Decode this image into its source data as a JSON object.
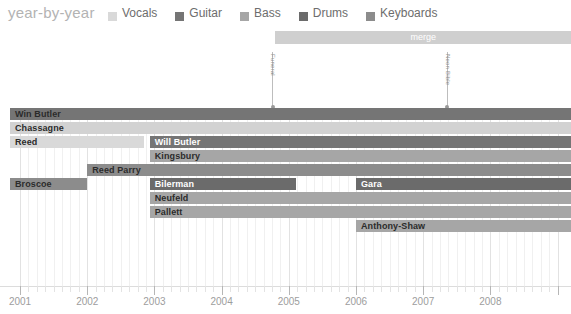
{
  "header": {
    "title": "year-by-year",
    "legend": [
      {
        "label": "Vocals",
        "color": "#d9d9d9"
      },
      {
        "label": "Guitar",
        "color": "#757575"
      },
      {
        "label": "Bass",
        "color": "#a6a6a6"
      },
      {
        "label": "Drums",
        "color": "#6b6b6b"
      },
      {
        "label": "Keyboards",
        "color": "#8c8c8c"
      }
    ]
  },
  "merge": {
    "label": "merge",
    "start_year": 2004.8,
    "end_year": 2009.2,
    "color": "#cfcfcf"
  },
  "markers": [
    {
      "label": "Funeral",
      "year": 2004.75
    },
    {
      "label": "Neon Bible",
      "year": 2007.35
    }
  ],
  "axis": {
    "ticks": [
      "2001",
      "2002",
      "2003",
      "2004",
      "2005",
      "2006",
      "2007",
      "2008"
    ],
    "xmin": 2000.85,
    "xmax": 2009.2
  },
  "colors": {
    "vocals": "#d9d9d9",
    "guitar": "#757575",
    "bass": "#a6a6a6",
    "drums": "#6b6b6b",
    "keyboards": "#8c8c8c",
    "background": "#ffffff",
    "grid": "#f0f0f0",
    "axis_text": "#9d9d9d"
  },
  "chart_data": {
    "type": "bar",
    "title": "year-by-year",
    "xlabel": "",
    "ylabel": "",
    "xlim": [
      2000.85,
      2009.2
    ],
    "grid": true,
    "legend_position": "top",
    "categories": [
      "Win Butler",
      "Chassagne",
      "Reed",
      "Will Butler",
      "Kingsbury",
      "Reed Parry",
      "Broscoe",
      "Bilerman",
      "Gara",
      "Neufeld",
      "Pallett",
      "Anthony-Shaw"
    ],
    "rows": [
      {
        "index": 0,
        "top": 0,
        "height": 12,
        "segments": [
          {
            "name": "Win Butler",
            "label": "Win Butler",
            "instrument": "Guitar",
            "start": 2000.85,
            "end": 2009.2,
            "color": "#757575",
            "label_color": "dark"
          }
        ]
      },
      {
        "index": 1,
        "top": 14,
        "height": 12,
        "segments": [
          {
            "name": "Chassagne",
            "label": "Chassagne",
            "instrument": "Vocals",
            "start": 2000.85,
            "end": 2009.2,
            "color": "#d2d2d2",
            "label_color": "dark"
          }
        ]
      },
      {
        "index": 2,
        "top": 28,
        "height": 12,
        "segments": [
          {
            "name": "Reed",
            "label": "Reed",
            "instrument": "Vocals",
            "start": 2000.85,
            "end": 2002.85,
            "color": "#d9d9d9",
            "label_color": "dark"
          },
          {
            "name": "Will Butler",
            "label": "Will Butler",
            "instrument": "Guitar",
            "start": 2002.93,
            "end": 2009.2,
            "color": "#757575",
            "label_color": "light"
          }
        ]
      },
      {
        "index": 3,
        "top": 42,
        "height": 12,
        "segments": [
          {
            "name": "Kingsbury",
            "label": "Kingsbury",
            "instrument": "Bass",
            "start": 2002.93,
            "end": 2009.2,
            "color": "#a6a6a6",
            "label_color": "dark"
          }
        ]
      },
      {
        "index": 4,
        "top": 56,
        "height": 12,
        "segments": [
          {
            "name": "Reed Parry",
            "label": "Reed Parry",
            "instrument": "Keyboards",
            "start": 2002.0,
            "end": 2009.2,
            "color": "#8c8c8c",
            "label_color": "dark"
          }
        ]
      },
      {
        "index": 5,
        "top": 70,
        "height": 12,
        "segments": [
          {
            "name": "Broscoe",
            "label": "Broscoe",
            "instrument": "Keyboards",
            "start": 2000.85,
            "end": 2002.0,
            "color": "#8c8c8c",
            "label_color": "dark"
          },
          {
            "name": "Bilerman",
            "label": "Bilerman",
            "instrument": "Drums",
            "start": 2002.93,
            "end": 2005.1,
            "color": "#6b6b6b",
            "label_color": "light"
          },
          {
            "name": "Gara",
            "label": "Gara",
            "instrument": "Drums",
            "start": 2006.0,
            "end": 2009.2,
            "color": "#6b6b6b",
            "label_color": "light"
          }
        ]
      },
      {
        "index": 6,
        "top": 84,
        "height": 12,
        "segments": [
          {
            "name": "Neufeld",
            "label": "Neufeld",
            "instrument": "Keyboards",
            "start": 2002.93,
            "end": 2009.2,
            "color": "#a6a6a6",
            "label_color": "dark"
          }
        ]
      },
      {
        "index": 7,
        "top": 98,
        "height": 12,
        "segments": [
          {
            "name": "Pallett",
            "label": "Pallett",
            "instrument": "Keyboards",
            "start": 2002.93,
            "end": 2009.2,
            "color": "#a6a6a6",
            "label_color": "dark"
          }
        ]
      },
      {
        "index": 8,
        "top": 112,
        "height": 12,
        "segments": [
          {
            "name": "Anthony-Shaw",
            "label": "Anthony-Shaw",
            "instrument": "Keyboards",
            "start": 2006.0,
            "end": 2009.2,
            "color": "#a6a6a6",
            "label_color": "dark"
          }
        ]
      }
    ]
  }
}
